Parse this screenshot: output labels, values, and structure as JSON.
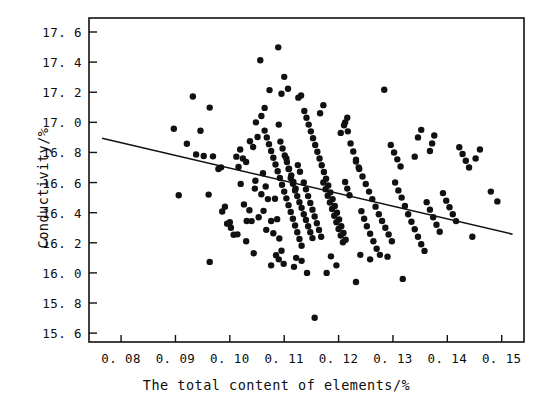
{
  "chart_data": {
    "type": "scatter",
    "title": "",
    "xlabel": "The total content of elements/%",
    "ylabel": "Conductivity/%",
    "xlim": [
      0.0741,
      0.1541
    ],
    "ylim": [
      15.541,
      17.693
    ],
    "grid": false,
    "legend": null,
    "xticks": [
      0.08,
      0.09,
      0.1,
      0.11,
      0.12,
      0.13,
      0.14,
      0.15
    ],
    "xtick_labels": [
      "0. 08",
      "0. 09",
      "0. 10",
      "0. 11",
      "0. 12",
      "0. 13",
      "0. 14",
      "0. 15"
    ],
    "yticks": [
      15.6,
      15.8,
      16.0,
      16.2,
      16.4,
      16.6,
      16.8,
      17.0,
      17.2,
      17.4,
      17.6
    ],
    "ytick_labels": [
      "15. 6",
      "15. 8",
      "16. 0",
      "16. 2",
      "16. 4",
      "16. 6",
      "16. 8",
      "17. 0",
      "17. 2",
      "17. 4",
      "17. 6"
    ],
    "marker": "filled-circle",
    "marker_color": "#111111",
    "marker_size": 4.2,
    "n_points": 232,
    "trendline": {
      "type": "linear-fit",
      "color": "#111111",
      "x0": 0.0765,
      "y0": 16.895,
      "x1": 0.152,
      "y1": 16.257,
      "slope": -8.45,
      "intercept": 17.541
    },
    "points": [
      [
        0.0897,
        16.957
      ],
      [
        0.0906,
        16.516
      ],
      [
        0.0932,
        17.172
      ],
      [
        0.0946,
        16.944
      ],
      [
        0.0963,
        17.098
      ],
      [
        0.0921,
        16.858
      ],
      [
        0.0938,
        16.787
      ],
      [
        0.0952,
        16.776
      ],
      [
        0.0969,
        16.774
      ],
      [
        0.0979,
        16.69
      ],
      [
        0.0984,
        16.701
      ],
      [
        0.0991,
        16.44
      ],
      [
        0.0995,
        16.327
      ],
      [
        0.0963,
        16.073
      ],
      [
        0.1002,
        16.3
      ],
      [
        0.1007,
        16.253
      ],
      [
        0.0961,
        16.52
      ],
      [
        0.1019,
        16.82
      ],
      [
        0.1024,
        16.76
      ],
      [
        0.103,
        16.737
      ],
      [
        0.1036,
        16.416
      ],
      [
        0.104,
        16.344
      ],
      [
        0.1046,
        16.56
      ],
      [
        0.1051,
        16.903
      ],
      [
        0.1056,
        17.412
      ],
      [
        0.1061,
        16.662
      ],
      [
        0.1066,
        16.574
      ],
      [
        0.107,
        16.49
      ],
      [
        0.1076,
        16.345
      ],
      [
        0.108,
        16.263
      ],
      [
        0.1085,
        16.118
      ],
      [
        0.1037,
        16.874
      ],
      [
        0.1043,
        16.836
      ],
      [
        0.1048,
        17.0
      ],
      [
        0.109,
        16.985
      ],
      [
        0.1095,
        17.19
      ],
      [
        0.11,
        17.302
      ],
      [
        0.1104,
        16.76
      ],
      [
        0.1108,
        16.69
      ],
      [
        0.1112,
        16.63
      ],
      [
        0.1116,
        16.592
      ],
      [
        0.112,
        16.548
      ],
      [
        0.1124,
        16.51
      ],
      [
        0.1128,
        16.47
      ],
      [
        0.1132,
        16.432
      ],
      [
        0.1136,
        16.39
      ],
      [
        0.114,
        16.352
      ],
      [
        0.1144,
        16.31
      ],
      [
        0.1148,
        16.27
      ],
      [
        0.1152,
        16.231
      ],
      [
        0.1093,
        16.872
      ],
      [
        0.1097,
        16.826
      ],
      [
        0.1101,
        16.78
      ],
      [
        0.1105,
        16.736
      ],
      [
        0.1109,
        16.692
      ],
      [
        0.1113,
        16.648
      ],
      [
        0.1117,
        16.604
      ],
      [
        0.1121,
        16.56
      ],
      [
        0.1125,
        16.716
      ],
      [
        0.1129,
        16.672
      ],
      [
        0.1064,
        16.945
      ],
      [
        0.1068,
        16.9
      ],
      [
        0.1072,
        16.855
      ],
      [
        0.1076,
        16.81
      ],
      [
        0.108,
        16.765
      ],
      [
        0.1084,
        16.72
      ],
      [
        0.1088,
        16.675
      ],
      [
        0.1092,
        16.63
      ],
      [
        0.1096,
        16.585
      ],
      [
        0.11,
        16.54
      ],
      [
        0.1104,
        16.495
      ],
      [
        0.1108,
        16.45
      ],
      [
        0.1112,
        16.405
      ],
      [
        0.1116,
        16.36
      ],
      [
        0.112,
        16.315
      ],
      [
        0.1124,
        16.27
      ],
      [
        0.1128,
        16.225
      ],
      [
        0.1132,
        16.18
      ],
      [
        0.1136,
        16.6
      ],
      [
        0.114,
        16.555
      ],
      [
        0.1144,
        16.51
      ],
      [
        0.1148,
        16.465
      ],
      [
        0.1152,
        16.42
      ],
      [
        0.1156,
        16.375
      ],
      [
        0.116,
        16.33
      ],
      [
        0.1164,
        16.285
      ],
      [
        0.1168,
        16.24
      ],
      [
        0.1172,
        16.6
      ],
      [
        0.1176,
        16.556
      ],
      [
        0.118,
        16.512
      ],
      [
        0.1184,
        16.468
      ],
      [
        0.1188,
        16.424
      ],
      [
        0.1192,
        16.38
      ],
      [
        0.1196,
        16.336
      ],
      [
        0.12,
        16.292
      ],
      [
        0.1204,
        16.248
      ],
      [
        0.1208,
        16.204
      ],
      [
        0.1212,
        16.604
      ],
      [
        0.1216,
        16.56
      ],
      [
        0.122,
        16.516
      ],
      [
        0.1137,
        17.075
      ],
      [
        0.1141,
        17.03
      ],
      [
        0.1145,
        16.985
      ],
      [
        0.1149,
        16.94
      ],
      [
        0.1153,
        16.895
      ],
      [
        0.1157,
        16.85
      ],
      [
        0.1161,
        16.805
      ],
      [
        0.1165,
        16.76
      ],
      [
        0.1169,
        16.715
      ],
      [
        0.1173,
        16.67
      ],
      [
        0.1177,
        16.625
      ],
      [
        0.1181,
        16.58
      ],
      [
        0.1185,
        16.535
      ],
      [
        0.1189,
        16.49
      ],
      [
        0.1193,
        16.445
      ],
      [
        0.1197,
        16.4
      ],
      [
        0.1201,
        16.355
      ],
      [
        0.1205,
        16.31
      ],
      [
        0.1209,
        16.265
      ],
      [
        0.1213,
        16.22
      ],
      [
        0.1047,
        16.612
      ],
      [
        0.1053,
        16.37
      ],
      [
        0.1058,
        16.522
      ],
      [
        0.1062,
        16.412
      ],
      [
        0.1067,
        16.286
      ],
      [
        0.102,
        16.591
      ],
      [
        0.1026,
        16.455
      ],
      [
        0.1031,
        16.345
      ],
      [
        0.1016,
        16.704
      ],
      [
        0.1012,
        16.772
      ],
      [
        0.1089,
        17.498
      ],
      [
        0.1107,
        17.223
      ],
      [
        0.1126,
        17.164
      ],
      [
        0.1131,
        17.178
      ],
      [
        0.1073,
        17.214
      ],
      [
        0.1083,
        16.492
      ],
      [
        0.1087,
        16.357
      ],
      [
        0.1091,
        16.228
      ],
      [
        0.1095,
        16.147
      ],
      [
        0.1099,
        16.06
      ],
      [
        0.1232,
        16.74
      ],
      [
        0.1238,
        16.69
      ],
      [
        0.1244,
        16.64
      ],
      [
        0.125,
        16.59
      ],
      [
        0.1256,
        16.54
      ],
      [
        0.1262,
        16.49
      ],
      [
        0.1268,
        16.44
      ],
      [
        0.1274,
        16.39
      ],
      [
        0.128,
        16.345
      ],
      [
        0.1286,
        16.3
      ],
      [
        0.1292,
        16.255
      ],
      [
        0.1298,
        16.21
      ],
      [
        0.1222,
        16.86
      ],
      [
        0.1227,
        16.806
      ],
      [
        0.1232,
        16.752
      ],
      [
        0.1237,
        16.7
      ],
      [
        0.1242,
        16.41
      ],
      [
        0.1247,
        16.36
      ],
      [
        0.1252,
        16.31
      ],
      [
        0.1258,
        16.26
      ],
      [
        0.1264,
        16.21
      ],
      [
        0.127,
        16.16
      ],
      [
        0.1276,
        16.12
      ],
      [
        0.1217,
        16.94
      ],
      [
        0.1212,
        17.0
      ],
      [
        0.1304,
        16.6
      ],
      [
        0.131,
        16.548
      ],
      [
        0.1316,
        16.5
      ],
      [
        0.1322,
        16.444
      ],
      [
        0.1328,
        16.39
      ],
      [
        0.1334,
        16.34
      ],
      [
        0.134,
        16.29
      ],
      [
        0.1346,
        16.24
      ],
      [
        0.1352,
        16.19
      ],
      [
        0.1358,
        16.146
      ],
      [
        0.1296,
        16.85
      ],
      [
        0.1302,
        16.8
      ],
      [
        0.1308,
        16.754
      ],
      [
        0.1314,
        16.707
      ],
      [
        0.1284,
        17.216
      ],
      [
        0.1362,
        16.47
      ],
      [
        0.1368,
        16.42
      ],
      [
        0.1374,
        16.37
      ],
      [
        0.138,
        16.32
      ],
      [
        0.1386,
        16.273
      ],
      [
        0.1392,
        16.53
      ],
      [
        0.1398,
        16.48
      ],
      [
        0.1404,
        16.436
      ],
      [
        0.141,
        16.39
      ],
      [
        0.1416,
        16.344
      ],
      [
        0.1422,
        16.835
      ],
      [
        0.1428,
        16.79
      ],
      [
        0.1434,
        16.745
      ],
      [
        0.144,
        16.7
      ],
      [
        0.1368,
        16.81
      ],
      [
        0.1372,
        16.86
      ],
      [
        0.1376,
        16.913
      ],
      [
        0.1346,
        16.9
      ],
      [
        0.1352,
        16.95
      ],
      [
        0.134,
        16.772
      ],
      [
        0.146,
        16.82
      ],
      [
        0.148,
        16.54
      ],
      [
        0.1492,
        16.475
      ],
      [
        0.1452,
        16.76
      ],
      [
        0.1446,
        16.24
      ],
      [
        0.1156,
        15.702
      ],
      [
        0.1142,
        16.0
      ],
      [
        0.1178,
        16.0
      ],
      [
        0.1232,
        15.94
      ],
      [
        0.1318,
        15.96
      ],
      [
        0.1076,
        16.05
      ],
      [
        0.109,
        16.09
      ],
      [
        0.1118,
        16.04
      ],
      [
        0.1196,
        16.05
      ],
      [
        0.1258,
        16.09
      ],
      [
        0.1044,
        16.13
      ],
      [
        0.103,
        16.21
      ],
      [
        0.1014,
        16.256
      ],
      [
        0.1,
        16.336
      ],
      [
        0.0986,
        16.408
      ],
      [
        0.1204,
        16.93
      ],
      [
        0.121,
        16.98
      ],
      [
        0.1216,
        17.03
      ],
      [
        0.1166,
        17.06
      ],
      [
        0.1172,
        17.114
      ],
      [
        0.1058,
        17.042
      ],
      [
        0.1064,
        17.096
      ],
      [
        0.1122,
        16.1
      ],
      [
        0.1132,
        16.08
      ],
      [
        0.1186,
        16.11
      ],
      [
        0.124,
        16.12
      ],
      [
        0.129,
        16.108
      ]
    ]
  }
}
